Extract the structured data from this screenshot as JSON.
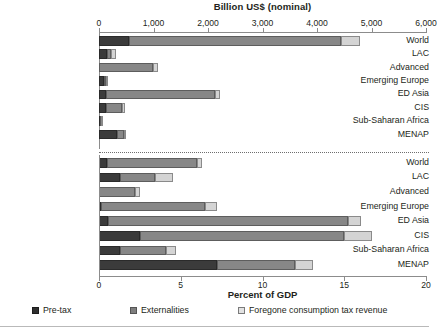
{
  "chart_data": {
    "type": "bar",
    "orientation": "horizontal",
    "stacked": true,
    "title": "",
    "panels": [
      {
        "name": "nominal",
        "xlabel": "Billion US$ (nominal)",
        "xlim": [
          0,
          6000
        ],
        "xticks": [
          0,
          1000,
          2000,
          3000,
          4000,
          5000,
          6000
        ],
        "xticklabels": [
          "0",
          "1,000",
          "2,000",
          "3,000",
          "4,000",
          "5,000",
          "6,000"
        ],
        "categories": [
          "World",
          "LAC",
          "Advanced",
          "Emerging Europe",
          "ED Asia",
          "CIS",
          "Sub-Saharan Africa",
          "MENAP"
        ],
        "series": [
          {
            "name": "Pre-tax",
            "values": [
              550,
              150,
              0,
              95,
              130,
              130,
              22,
              330
            ]
          },
          {
            "name": "Externalities",
            "values": [
              3890,
              70,
              985,
              30,
              1990,
              290,
              15,
              130
            ]
          },
          {
            "name": "Foregone consumption tax revenue",
            "values": [
              350,
              90,
              95,
              20,
              95,
              55,
              8,
              10
            ]
          }
        ]
      },
      {
        "name": "percent_of_gdp",
        "xlabel": "Percent of GDP",
        "xlim": [
          0,
          20
        ],
        "xticks": [
          0,
          5,
          10,
          15,
          20
        ],
        "xticklabels": [
          "0",
          "5",
          "10",
          "15",
          "20"
        ],
        "categories": [
          "World",
          "LAC",
          "Advanced",
          "Emerging Europe",
          "ED Asia",
          "CIS",
          "Sub-Saharan Africa",
          "MENAP"
        ],
        "series": [
          {
            "name": "Pre-tax",
            "values": [
              0.5,
              1.3,
              0.0,
              0.1,
              0.55,
              2.5,
              1.3,
              7.2
            ]
          },
          {
            "name": "Externalities",
            "values": [
              5.5,
              2.1,
              2.2,
              6.4,
              14.65,
              12.5,
              2.8,
              4.8
            ]
          },
          {
            "name": "Foregone consumption tax revenue",
            "values": [
              0.3,
              1.1,
              0.3,
              0.7,
              0.8,
              1.7,
              0.6,
              1.1
            ]
          }
        ]
      }
    ],
    "legend": {
      "position": "bottom",
      "entries": [
        "Pre-tax",
        "Externalities",
        "Foregone consumption tax revenue"
      ]
    },
    "colors": {
      "pre_tax": "#3b3b3b",
      "externalities": "#878787",
      "foregone_consumption_tax_revenue": "#d4d4d4",
      "axis": "#8c8c8c",
      "text": "#231f20"
    },
    "grid": false
  },
  "top_panel": {
    "axis_title": "Billion US$ (nominal)",
    "ticklabels": [
      "0",
      "1,000",
      "2,000",
      "3,000",
      "4,000",
      "5,000",
      "6,000"
    ],
    "categories": [
      "World",
      "LAC",
      "Advanced",
      "Emerging Europe",
      "ED Asia",
      "CIS",
      "Sub-Saharan Africa",
      "MENAP"
    ]
  },
  "bottom_panel": {
    "axis_title": "Percent of GDP",
    "ticklabels": [
      "0",
      "5",
      "10",
      "15",
      "20"
    ],
    "categories": [
      "World",
      "LAC",
      "Advanced",
      "Emerging Europe",
      "ED Asia",
      "CIS",
      "Sub-Saharan Africa",
      "MENAP"
    ]
  },
  "legend": {
    "pre_tax": "Pre-tax",
    "externalities": "Externalities",
    "foregone": "Foregone consumption tax revenue"
  }
}
